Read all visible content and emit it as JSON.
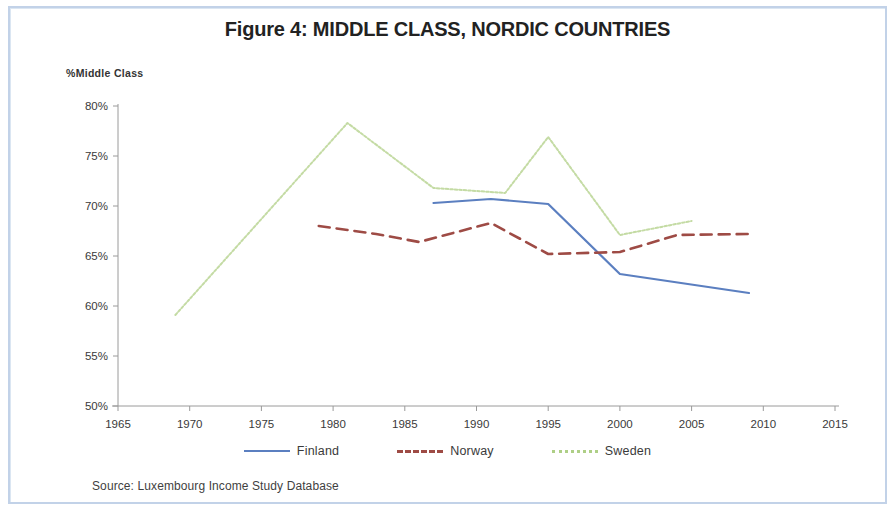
{
  "figure": {
    "title": "Figure 4: MIDDLE CLASS, NORDIC COUNTRIES",
    "source": "Source: Luxembourg Income Study Database",
    "frame_color": "#c2d2e8",
    "background": "#ffffff"
  },
  "chart_data": {
    "type": "line",
    "title": "Figure 4: MIDDLE CLASS, NORDIC COUNTRIES",
    "xlabel": "",
    "ylabel": "%Middle Class",
    "xlim": [
      1965,
      2015
    ],
    "ylim": [
      50,
      80
    ],
    "grid": false,
    "legend_position": "bottom",
    "x_ticks": [
      1965,
      1970,
      1975,
      1980,
      1985,
      1990,
      1995,
      2000,
      2005,
      2010,
      2015
    ],
    "x_tick_labels": [
      "1965",
      "1970",
      "1975",
      "1980",
      "1985",
      "1990",
      "1995",
      "2000",
      "2005",
      "2010",
      "2015"
    ],
    "y_ticks": [
      50,
      55,
      60,
      65,
      70,
      75,
      80
    ],
    "y_tick_labels": [
      "50%",
      "55%",
      "60%",
      "65%",
      "70%",
      "75%",
      "80%"
    ],
    "series": [
      {
        "name": "Finland",
        "color": "#5b7fc0",
        "style": "solid",
        "x": [
          1987,
          1991,
          1995,
          2000,
          2009
        ],
        "values": [
          70.3,
          70.7,
          70.2,
          63.2,
          61.3
        ]
      },
      {
        "name": "Norway",
        "color": "#9e4b45",
        "style": "dashed",
        "x": [
          1979,
          1983,
          1986,
          1991,
          1995,
          2000,
          2004,
          2009
        ],
        "values": [
          68.0,
          67.2,
          66.4,
          68.3,
          65.2,
          65.4,
          67.1,
          67.2
        ]
      },
      {
        "name": "Sweden",
        "color": "#c4dba4",
        "style": "dotted",
        "x": [
          1969,
          1981,
          1987,
          1992,
          1995,
          2000,
          2005
        ],
        "values": [
          59.1,
          78.3,
          71.8,
          71.3,
          76.9,
          67.1,
          68.5
        ]
      }
    ]
  },
  "legend": [
    {
      "label": "Finland",
      "color": "#5b7fc0",
      "style": "solid"
    },
    {
      "label": "Norway",
      "color": "#9e4b45",
      "style": "dashed"
    },
    {
      "label": "Sweden",
      "color": "#aecf86",
      "style": "dotted"
    }
  ]
}
